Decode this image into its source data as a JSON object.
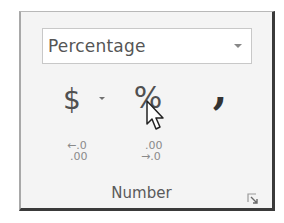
{
  "ribbon_group": {
    "label": "Number",
    "number_format": {
      "selected": "Percentage",
      "icon": "chevron-down-icon"
    },
    "buttons": {
      "currency": {
        "glyph": "$",
        "icon": "dollar-icon"
      },
      "percent": {
        "glyph": "%",
        "icon": "percent-icon"
      },
      "comma": {
        "glyph": ",",
        "icon": "comma-style-icon"
      },
      "decrease_decimal": {
        "line1": "←.0",
        "line2": ".00",
        "icon": "decrease-decimal-icon"
      },
      "increase_decimal": {
        "line1": ".00",
        "line2": "→.0",
        "icon": "increase-decimal-icon"
      }
    },
    "dialog_launcher_icon": "dialog-launcher-icon"
  },
  "colors": {
    "background": "#f4f4f4",
    "border_dark": "#3a3a3a",
    "text": "#555555"
  }
}
